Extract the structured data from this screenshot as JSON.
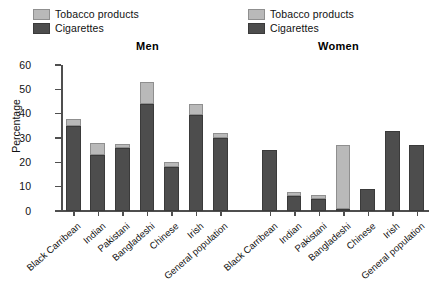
{
  "legend": {
    "items": [
      {
        "label": "Tobacco products",
        "color": "#b9b9b9",
        "icon": "square-swatch-icon"
      },
      {
        "label": "Cigarettes",
        "color": "#4d4d4d",
        "icon": "square-swatch-icon"
      }
    ]
  },
  "panels": {
    "men_title": "Men",
    "women_title": "Women"
  },
  "chart_data": {
    "type": "bar",
    "subtype": "stacked",
    "title": "",
    "xlabel": "",
    "ylabel": "Percentage",
    "ylim": [
      0,
      60
    ],
    "ytick_values": [
      0,
      10,
      20,
      30,
      40,
      50,
      60
    ],
    "ytick_labels": [
      "0",
      "10",
      "20",
      "30",
      "40",
      "50",
      "60"
    ],
    "grid": false,
    "legend_position": "top",
    "series_names": [
      "Cigarettes",
      "Tobacco products"
    ],
    "series_colors": {
      "Cigarettes": "#4d4d4d",
      "Tobacco products": "#b9b9b9"
    },
    "panels": [
      {
        "name": "Men",
        "categories": [
          "Black Carribean",
          "Indian",
          "Pakistani",
          "Bangladeshi",
          "Chinese",
          "Irish",
          "General population"
        ],
        "series": [
          {
            "name": "Cigarettes",
            "values": [
              35,
              23,
              26,
              44,
              18,
              39.5,
              30
            ]
          },
          {
            "name": "Tobacco products",
            "values": [
              3,
              5,
              1.5,
              9,
              2,
              4.5,
              2
            ]
          }
        ],
        "totals": [
          38,
          28,
          27.5,
          53,
          20,
          44,
          32
        ]
      },
      {
        "name": "Women",
        "categories": [
          "Black Carribean",
          "Indian",
          "Pakistani",
          "Bangladeshi",
          "Chinese",
          "Irish",
          "General population"
        ],
        "series": [
          {
            "name": "Cigarettes",
            "values": [
              25,
              6,
              5,
              1,
              9,
              33,
              27
            ]
          },
          {
            "name": "Tobacco products",
            "values": [
              0,
              2,
              1.5,
              26,
              0,
              0,
              0
            ]
          }
        ],
        "totals": [
          25,
          8,
          6.5,
          27,
          9,
          33,
          27
        ]
      }
    ]
  }
}
